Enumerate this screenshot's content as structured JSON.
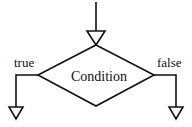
{
  "diagram": {
    "type": "flowchart-decision",
    "decision": {
      "label": "Condition"
    },
    "branches": [
      {
        "label": "true",
        "side": "left"
      },
      {
        "label": "false",
        "side": "right"
      }
    ],
    "stroke_color": "#111111",
    "fill_color": "#ffffff"
  }
}
